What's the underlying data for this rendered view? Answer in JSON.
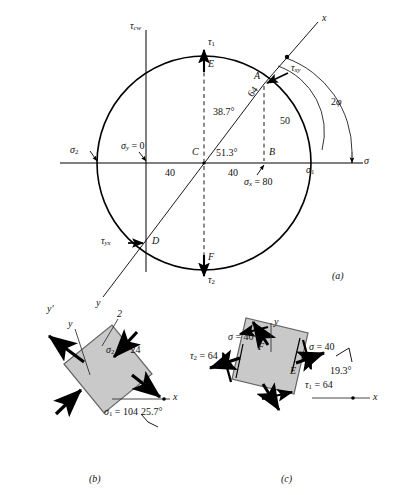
{
  "figure": {
    "type": "mohr-circle-stress-figure",
    "panels": [
      "(a)",
      "(b)",
      "(c)"
    ]
  },
  "panel_a": {
    "caption": "(a)",
    "axis_vertical_label": "τ",
    "axis_vertical_sub": "cw",
    "axis_horizontal_label": "σ",
    "x_axis_label": "x",
    "y_axis_label": "y",
    "points": {
      "A": "A",
      "B": "B",
      "C": "C",
      "D": "D",
      "E": "E",
      "F": "F"
    },
    "labels": {
      "tau_1": "τ",
      "tau_1_sub": "1",
      "tau_2": "τ",
      "tau_2_sub": "2",
      "tau_xy": "τ",
      "tau_xy_sub": "xy",
      "tau_yx": "τ",
      "tau_yx_sub": "yx",
      "sigma_1": "σ",
      "sigma_1_sub": "1",
      "sigma_2": "σ",
      "sigma_2_sub": "2",
      "sigma_y_zero": "σ",
      "sigma_y_zero_sub": "y",
      "sigma_y_zero_val": " = 0",
      "sigma_x_80": "σ",
      "sigma_x_80_sub": "x",
      "sigma_x_80_val": " = 80",
      "radius_value": "64",
      "height_value": "50",
      "left_segment": "40",
      "right_segment": "40",
      "angle_upper": "38.7°",
      "angle_lower": "51.3°",
      "two_phi": "2",
      "two_phi_sym": "φ"
    }
  },
  "panel_b": {
    "caption": "(b)",
    "axis_y_prime": "y",
    "axis_y_prime_mark": "′",
    "axis_y": "y",
    "axis_x": "x",
    "direction_2": "2",
    "sigma_2_label": "σ",
    "sigma_2_sub": "2",
    "sigma_2_value": " = −24",
    "sigma_1_label": "σ",
    "sigma_1_sub": "1",
    "sigma_1_value": " = 104",
    "angle": "25.7°"
  },
  "panel_c": {
    "caption": "(c)",
    "axis_y": "y",
    "axis_x": "x",
    "sigma_top_label": "σ",
    "sigma_top_value": " = 40",
    "sigma_right_label": "σ",
    "sigma_right_value": " = 40",
    "tau_2_label": "τ",
    "tau_2_sub": "2",
    "tau_2_value": " = 64",
    "tau_1_label": "τ",
    "tau_1_sub": "1",
    "tau_1_value": " = 64",
    "angle": "19.3°",
    "point_E": "E",
    "point_F": "F"
  },
  "colors": {
    "line": "#000000",
    "block_fill": "#c9c9c9",
    "block_stroke": "#555555",
    "thin": "#3a3a3a"
  }
}
